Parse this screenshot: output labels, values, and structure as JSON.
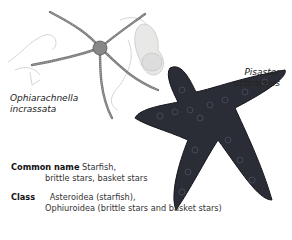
{
  "labels": {
    "species1": [
      "Ophiarachnella",
      "incrassata"
    ],
    "species2": [
      "Pisaster",
      "ochraceus"
    ]
  },
  "info": {
    "common_name": {
      "label": "Common name",
      "line1": "Starfish,",
      "line2": "brittle stars, basket stars"
    },
    "class": {
      "label": "Class",
      "line1": "Asteroidea (starfish),",
      "line2": "Ophiuroidea (brittle stars and basket stars)"
    }
  }
}
